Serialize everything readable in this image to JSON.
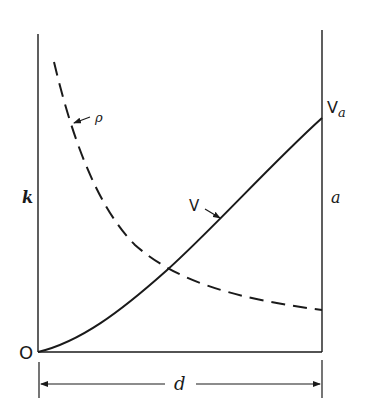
{
  "diagram": {
    "labels": {
      "left_axis": "k",
      "right_axis": "a",
      "origin": "O",
      "width_dim": "d",
      "curve_v": "V",
      "curve_rho": "ρ",
      "endpoint_v_main": "V",
      "endpoint_v_sub": "a"
    },
    "curves": [
      {
        "name": "V",
        "style": "solid",
        "description": "rising curve from origin to V_a at right axis"
      },
      {
        "name": "ρ",
        "style": "dashed",
        "description": "decreasing curve from top-left, flattening toward right axis"
      }
    ],
    "colors": {
      "ink": "#1a1a1a",
      "background": "#ffffff"
    }
  }
}
